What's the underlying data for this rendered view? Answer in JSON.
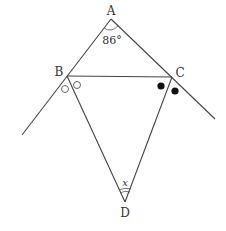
{
  "diagram": {
    "type": "geometry-figure",
    "points": {
      "A": {
        "label": "A"
      },
      "B": {
        "label": "B"
      },
      "C": {
        "label": "C"
      },
      "D": {
        "label": "D"
      }
    },
    "angle_A": {
      "label": "86°",
      "value_deg": 86
    },
    "angle_D": {
      "label": "x"
    },
    "marks": {
      "B_exterior_bisector": "open-circles (equal angles)",
      "C_exterior_bisector": "filled-circles (equal angles)"
    },
    "colors": {
      "line": "#444444",
      "background": "#ffffff"
    }
  }
}
